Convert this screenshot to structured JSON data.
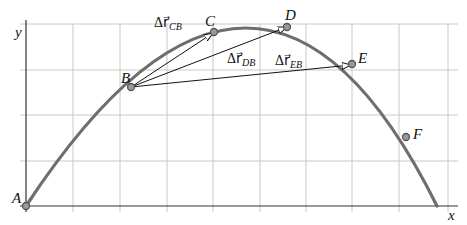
{
  "diagram": {
    "axes": {
      "x_label": "x",
      "y_label": "y"
    },
    "points": [
      {
        "id": "A",
        "label": "A"
      },
      {
        "id": "B",
        "label": "B"
      },
      {
        "id": "C",
        "label": "C"
      },
      {
        "id": "D",
        "label": "D"
      },
      {
        "id": "E",
        "label": "E"
      },
      {
        "id": "F",
        "label": "F"
      }
    ],
    "vectors": [
      {
        "id": "CB",
        "from": "B",
        "to": "C",
        "symbol": "Δr⃗",
        "subscript": "CB"
      },
      {
        "id": "DB",
        "from": "B",
        "to": "D",
        "symbol": "Δr⃗",
        "subscript": "DB"
      },
      {
        "id": "EB",
        "from": "B",
        "to": "E",
        "symbol": "Δr⃗",
        "subscript": "EB"
      }
    ],
    "colors": {
      "trajectory": "#6e6e6e",
      "grid": "#c8c8c8",
      "vector": "#111111"
    }
  }
}
